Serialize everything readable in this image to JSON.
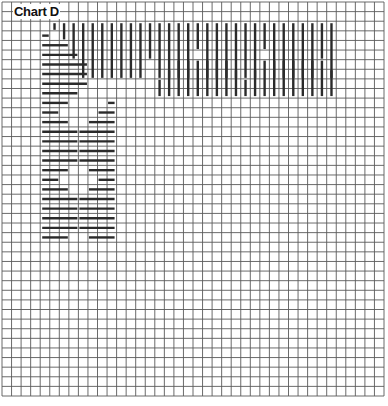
{
  "title": "Chart D",
  "grid": {
    "columns": 40,
    "rows": 41
  },
  "colors": {
    "grid": "#5a5a5a",
    "stitch": "#2b2b2b",
    "faint": "#c8c8c8",
    "background": "#ffffff"
  },
  "chart_data": {
    "type": "table",
    "title": "Chart D",
    "top_band": {
      "first_col": 5,
      "last_col": 34,
      "upper_rows": [
        2,
        8
      ],
      "lower_rows": [
        6,
        10
      ],
      "upper_lengths": [
        1,
        2,
        4,
        6,
        6,
        6,
        6,
        6,
        6,
        6,
        4,
        6,
        6,
        6,
        6,
        3,
        6,
        6,
        6,
        6,
        6,
        6,
        3,
        6,
        6,
        6,
        6,
        6,
        4,
        6
      ],
      "lower_lengths": [
        0,
        0,
        0,
        0,
        0,
        0,
        0,
        0,
        0,
        0,
        0,
        2,
        3,
        4,
        4,
        4,
        4,
        4,
        4,
        3,
        2,
        3,
        4,
        4,
        4,
        4,
        4,
        4,
        4,
        3
      ]
    },
    "left_band": {
      "first_row": 3,
      "last_row": 24,
      "left_col": 4,
      "left_lengths": [
        1,
        3,
        4,
        5,
        5,
        5,
        4,
        3,
        2,
        3,
        4,
        4,
        4,
        4,
        3,
        2,
        3,
        4,
        4,
        4,
        4,
        3
      ],
      "right_col": 8,
      "right_lengths": [
        0,
        0,
        0,
        0,
        0,
        0,
        0,
        1,
        2,
        3,
        4,
        4,
        4,
        4,
        3,
        2,
        3,
        4,
        4,
        4,
        4,
        3
      ]
    }
  }
}
